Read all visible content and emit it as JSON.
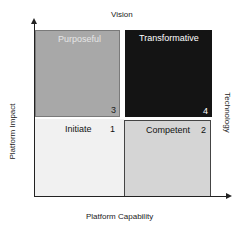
{
  "axes": {
    "top_label": "Vision",
    "right_label": "Technology",
    "y_label": "Platform Impact",
    "x_label": "Platform Capability"
  },
  "quadrants": [
    {
      "id": "top-left",
      "label": "Purposeful",
      "number": "3",
      "fill": "#a8a8a8",
      "text_color": "#e6e6e6"
    },
    {
      "id": "top-right",
      "label": "Transformative",
      "number": "4",
      "fill": "#141414",
      "text_color": "#ffffff"
    },
    {
      "id": "bottom-left",
      "label": "Initiate",
      "number": "1",
      "fill": "#f1f1f1",
      "text_color": "#111111"
    },
    {
      "id": "bottom-right",
      "label": "Competent",
      "number": "2",
      "fill": "#d5d5d5",
      "text_color": "#111111"
    }
  ]
}
